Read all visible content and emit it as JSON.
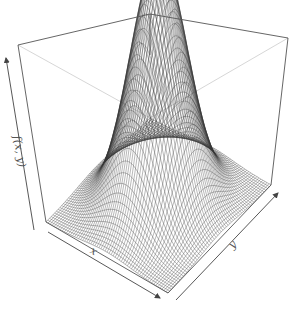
{
  "figure": {
    "kind": "3d-surface-wireframe",
    "colors": {
      "background": "#ffffff",
      "box_front": "#555555",
      "box_back": "#cccccc",
      "mesh": "#333333",
      "axis_arrow": "#444444",
      "label": "#555555"
    },
    "axes": {
      "x": {
        "label": "x"
      },
      "y": {
        "label": "y"
      },
      "z": {
        "label": "f(x, y)"
      }
    },
    "surface": {
      "function": "bivariate normal density",
      "peak": "centered",
      "grid_lines": 60
    }
  }
}
